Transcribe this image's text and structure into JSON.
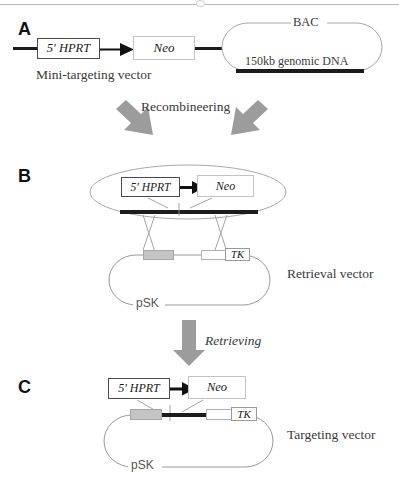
{
  "figure": {
    "background_color": "#ffffff",
    "width": 399,
    "height": 491
  },
  "colors": {
    "arrow_gray": "#9c9c9c",
    "dna_black": "#1c1c1c",
    "homology_arm_gray": "#c4c4c4",
    "plasmid_outline": "#9a9a9a",
    "text": "#3a3a3a",
    "panel_letter": "#111111",
    "rule": "#b9bcc0"
  },
  "panels": [
    {
      "letter": "A",
      "mini_vector": {
        "genes": [
          {
            "name": "hprt-box",
            "label": "5' HPRT"
          },
          {
            "name": "neo-box",
            "label": "Neo"
          }
        ],
        "caption": "Mini-targeting vector",
        "arrow_name": "promoter-arrow"
      },
      "bac": {
        "name": "bac-plasmid",
        "top_label": "BAC",
        "insert_label": "150kb genomic DNA"
      }
    },
    {
      "letter": "B",
      "step_label": "Recombineering",
      "bac_recombined": {
        "genes": [
          {
            "name": "hprt-box",
            "label": "5' HPRT"
          },
          {
            "name": "neo-box",
            "label": "Neo"
          }
        ]
      },
      "retrieval_vector": {
        "name": "retrieval-vector-plasmid",
        "backbone_label": "pSK",
        "tk_label": "TK",
        "caption": "Retrieval vector"
      }
    },
    {
      "letter": "C",
      "step_label": "Retrieving",
      "targeting_vector": {
        "genes": [
          {
            "name": "hprt-box",
            "label": "5' HPRT"
          },
          {
            "name": "neo-box",
            "label": "Neo"
          }
        ],
        "name": "targeting-vector-plasmid",
        "backbone_label": "pSK",
        "tk_label": "TK",
        "caption": "Targeting vector"
      }
    }
  ],
  "labels": {
    "letter_a": "A",
    "letter_b": "B",
    "letter_c": "C",
    "hprt": "5' HPRT",
    "neo": "Neo",
    "tk": "TK",
    "psk": "pSK",
    "bac": "BAC",
    "genomic_dna": "150kb genomic DNA",
    "mini_targeting_vector": "Mini-targeting vector",
    "recombineering": "Recombineering",
    "retrieving": "Retrieving",
    "retrieval_vector": "Retrieval vector",
    "targeting_vector": "Targeting vector"
  }
}
